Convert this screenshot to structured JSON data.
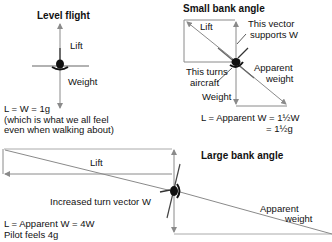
{
  "panels": {
    "level": {
      "title": "Level flight",
      "lift_label": "Lift",
      "weight_label": "Weight",
      "equation": "L = W = 1g",
      "note_line1": "(which is what we all feel",
      "note_line2": "even when walking about)"
    },
    "small": {
      "title": "Small bank angle",
      "lift_label": "Lift",
      "supports_line1": "This vector",
      "supports_line2": "supports W",
      "turns_line1": "This turns",
      "turns_line2": "aircraft",
      "apparent_line1": "Apparent",
      "apparent_line2": "weight",
      "weight_label": "Weight",
      "equation_line1": "L = Apparent W = 1½W",
      "equation_line2": "= 1½g"
    },
    "large": {
      "title": "Large bank angle",
      "lift_label": "Lift",
      "turn_label": "Increased turn vector W",
      "apparent_line1": "Apparent",
      "apparent_line2": "weight",
      "equation": "L = Apparent W = 4W",
      "pilot_note": "Pilot feels 4g"
    }
  },
  "colors": {
    "vector": "#8a8a8a",
    "text": "#111111",
    "aircraft": "#111111"
  }
}
